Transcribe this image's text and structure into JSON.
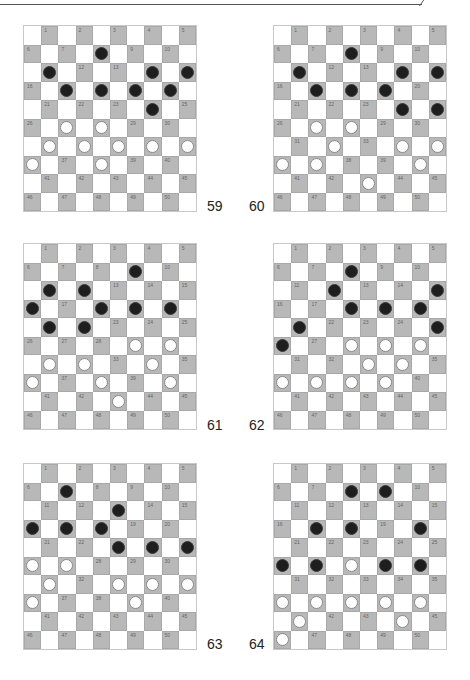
{
  "colors": {
    "dark_square": "#b8b8b8",
    "light_square": "#ffffff",
    "black_piece": "#1e1e1e",
    "white_piece": "#ffffff"
  },
  "diagrams": [
    {
      "number": "59",
      "black": [
        8,
        11,
        14,
        15,
        17,
        18,
        19,
        20,
        24
      ],
      "white": [
        27,
        28,
        31,
        32,
        33,
        34,
        35,
        36,
        38
      ]
    },
    {
      "number": "60",
      "black": [
        8,
        11,
        14,
        15,
        17,
        18,
        19,
        24,
        25
      ],
      "white": [
        27,
        28,
        32,
        34,
        35,
        36,
        37,
        40,
        43
      ]
    },
    {
      "number": "61",
      "black": [
        9,
        11,
        12,
        16,
        18,
        19,
        20,
        21,
        22
      ],
      "white": [
        29,
        30,
        31,
        32,
        34,
        36,
        38,
        40,
        43
      ]
    },
    {
      "number": "62",
      "black": [
        8,
        12,
        15,
        18,
        19,
        20,
        21,
        25,
        26
      ],
      "white": [
        28,
        29,
        30,
        33,
        34,
        36,
        37,
        38,
        39
      ]
    },
    {
      "number": "63",
      "black": [
        7,
        13,
        16,
        17,
        18,
        23,
        24,
        25
      ],
      "white": [
        26,
        27,
        31,
        33,
        34,
        35,
        36,
        39
      ]
    },
    {
      "number": "64",
      "black": [
        8,
        9,
        17,
        18,
        20,
        26,
        27,
        29,
        30
      ],
      "white": [
        28,
        36,
        37,
        38,
        39,
        40,
        41,
        44,
        46
      ]
    }
  ]
}
